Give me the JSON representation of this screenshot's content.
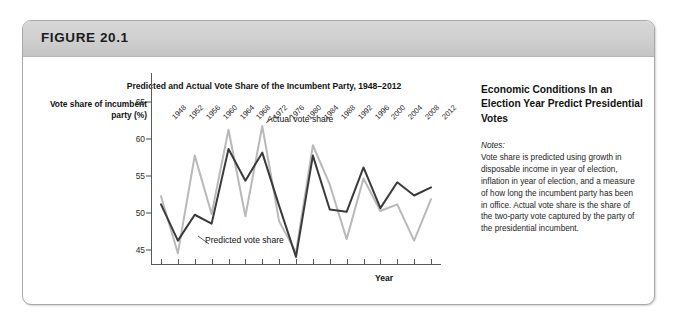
{
  "figure": {
    "label": "FIGURE 20.1"
  },
  "notes_panel": {
    "heading": "Economic Conditions In an Election Year Predict Presidential Votes",
    "notes_label": "Notes:",
    "notes_body": "Vote share is predicted using growth in disposable income in year of election, inflation in year of election, and a measure of how long the incumbent party has been in office. Actual vote share is the share of the two-party vote captured by the party of the presidential incumbent."
  },
  "annotations": {
    "actual": "Actual vote share",
    "predicted": "Predicted vote share"
  },
  "colors": {
    "predicted": "#3a3a3a",
    "actual": "#b9b9b9",
    "axis": "#5a5a5a",
    "banner": "#cfcfcf",
    "border": "#a8a8a8"
  },
  "chart_data": {
    "type": "line",
    "title": "Predicted and Actual Vote Share of the Incumbent Party, 1948–2012",
    "xlabel": "Year",
    "ylabel": "Vote share of incumbent party (%)",
    "ylim": [
      43,
      66
    ],
    "yticks": [
      45,
      50,
      55,
      60,
      65
    ],
    "grid": false,
    "legend_position": "inline-annotations",
    "categories": [
      1948,
      1952,
      1956,
      1960,
      1964,
      1968,
      1972,
      1976,
      1980,
      1984,
      1988,
      1992,
      1996,
      2000,
      2004,
      2008,
      2012
    ],
    "series": [
      {
        "name": "Predicted vote share",
        "color": "#3a3a3a",
        "values": [
          51.2,
          46.3,
          49.8,
          48.6,
          58.7,
          54.4,
          58.2,
          51.0,
          44.1,
          57.8,
          50.5,
          50.2,
          56.2,
          50.7,
          54.2,
          52.4,
          53.5
        ]
      },
      {
        "name": "Actual vote share",
        "color": "#b9b9b9",
        "values": [
          52.3,
          44.6,
          57.8,
          49.9,
          61.3,
          49.6,
          61.8,
          48.9,
          44.7,
          59.2,
          53.9,
          46.5,
          54.7,
          50.3,
          51.2,
          46.3,
          51.9
        ]
      }
    ]
  }
}
